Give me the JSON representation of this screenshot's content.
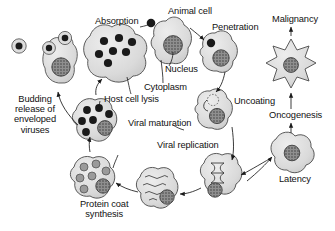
{
  "diagram": {
    "style": {
      "background": "#ffffff",
      "cell_fill": "#d8d8d8",
      "cell_fill_light": "#e2e2e2",
      "cell_stroke": "#4a4a4a",
      "virion_dark": "#1a1a1a",
      "virion_mid": "#8d8d8d",
      "nucleus_fill": "#8a8a8a",
      "text_color": "#111111",
      "arrow_color": "#1a1a1a"
    },
    "labels": [
      {
        "id": "absorption",
        "text": "Absorption",
        "x": 95,
        "y": 22
      },
      {
        "id": "animal-cell",
        "text": "Animal cell",
        "x": 168,
        "y": 12
      },
      {
        "id": "penetration",
        "text": "Penetration",
        "x": 212,
        "y": 28
      },
      {
        "id": "malignancy",
        "text": "Malignancy",
        "x": 274,
        "y": 20
      },
      {
        "id": "nucleus",
        "text": "Nucleus",
        "x": 165,
        "y": 68
      },
      {
        "id": "cytoplasm",
        "text": "Cytoplasm",
        "x": 146,
        "y": 84
      },
      {
        "id": "host-cell-lysis",
        "text": "Host cell lysis",
        "x": 103,
        "y": 95
      },
      {
        "id": "uncoating",
        "text": "Uncoating",
        "x": 232,
        "y": 99
      },
      {
        "id": "oncogenesis",
        "text": "Oncogenesis",
        "x": 269,
        "y": 114
      },
      {
        "id": "viral-maturation",
        "text": "Viral maturation",
        "x": 128,
        "y": 122
      },
      {
        "id": "viral-replication",
        "text": "Viral replication",
        "x": 157,
        "y": 144
      },
      {
        "id": "latency",
        "text": "Latency",
        "x": 279,
        "y": 178
      },
      {
        "id": "budding-release",
        "text": "Budding\nrelease of\nenveloped\nviruses",
        "x": 14,
        "y": 97
      },
      {
        "id": "protein-coat",
        "text": "Protein coat\nsynthesis",
        "x": 82,
        "y": 199
      }
    ],
    "stages": [
      {
        "id": "free-enveloped-virion",
        "label": "enveloped virus particle",
        "contents": "single enveloped virion"
      },
      {
        "id": "budding-cell",
        "label": "Budding release of enveloped viruses",
        "contents": "cell with 2 budding virions and nucleus"
      },
      {
        "id": "lysis-cell",
        "label": "Host cell lysis",
        "contents": "large irregular cell releasing 7 mature virions"
      },
      {
        "id": "animal-cell",
        "label": "Animal cell",
        "contents": "normal cell with nucleus, virion attached to membrane"
      },
      {
        "id": "penetration-cell",
        "label": "Penetration",
        "contents": "cell with virion inside cytoplasm"
      },
      {
        "id": "malignant-cell",
        "label": "Malignancy",
        "contents": "star-shaped transformed cell with nucleus"
      },
      {
        "id": "uncoating-cell",
        "label": "Uncoating",
        "contents": "cell with opened capsid releasing genome strand"
      },
      {
        "id": "latency-cell",
        "label": "Latency",
        "contents": "lobed cell with dark speckled nucleus"
      },
      {
        "id": "maturation-cell",
        "label": "Viral maturation",
        "contents": "cell with 6 assembled dark virions"
      },
      {
        "id": "replication-cell",
        "label": "Viral replication",
        "contents": "cell with helical genome coil and nucleus"
      },
      {
        "id": "transcription-cell",
        "label": "mRNA transcripts",
        "contents": "cell filled with wavy strands"
      },
      {
        "id": "protein-coat-cell",
        "label": "Protein coat synthesis",
        "contents": "cell with 7 immature gray capsids"
      }
    ]
  }
}
